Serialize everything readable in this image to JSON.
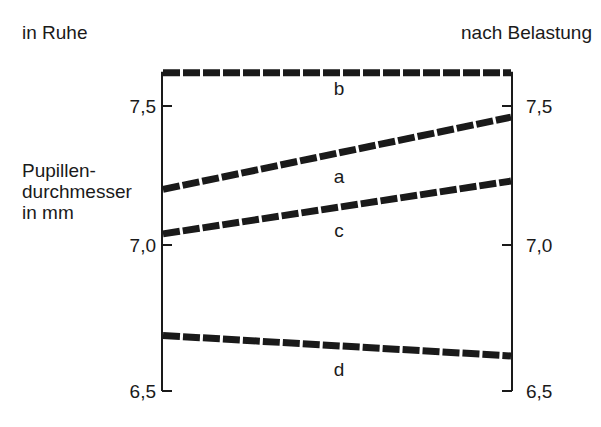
{
  "chart_data": {
    "type": "line",
    "title": "",
    "x": [
      "in Ruhe",
      "nach Belastung"
    ],
    "xlabel_left": "in Ruhe",
    "xlabel_right": "nach Belastung",
    "ylabel_lines": [
      "Pupillen-",
      "durchmesser",
      "in mm"
    ],
    "ylim": [
      6.5,
      7.62
    ],
    "yticks": [
      6.5,
      7.0,
      7.5
    ],
    "ytick_labels": [
      "6,5",
      "7,0",
      "7,5"
    ],
    "grid": false,
    "line_style": "dashed",
    "series": [
      {
        "name": "b",
        "values": [
          7.62,
          7.62
        ]
      },
      {
        "name": "a",
        "values": [
          7.2,
          7.46
        ]
      },
      {
        "name": "c",
        "values": [
          7.04,
          7.23
        ]
      },
      {
        "name": "d",
        "values": [
          6.69,
          6.62
        ]
      }
    ]
  }
}
